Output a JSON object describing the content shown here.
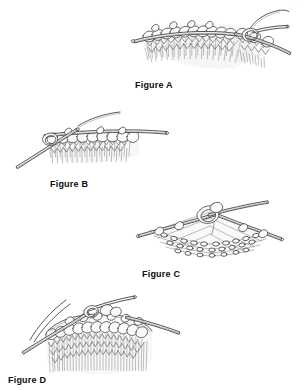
{
  "page": {
    "background_color": "#ffffff",
    "ink_color": "#3b3b3b",
    "caption_color": "#0d0d0d",
    "width": 304,
    "height": 390,
    "content_type": "knitting instruction line drawings"
  },
  "figures": [
    {
      "id": "figure-a",
      "caption": "Figure A",
      "description": "Knitted fabric on a straight needle with a second needle and working yarn at the right; stitches shown in stockinette",
      "art_name": "knitting-illustration-a",
      "x": 131,
      "y": 8,
      "caption_x": 135,
      "caption_y": 80
    },
    {
      "id": "figure-b",
      "caption": "Figure B",
      "description": "Knitted fabric on a needle held horizontally with a second needle crossing from the lower left and yarn strand above",
      "art_name": "knitting-illustration-b",
      "x": 14,
      "y": 110,
      "caption_x": 50,
      "caption_y": 179
    },
    {
      "id": "figure-c",
      "caption": "Figure C",
      "description": "Open knitted mesh stretched between two needles forming a peak with a loop at the top",
      "art_name": "knitting-illustration-c",
      "x": 130,
      "y": 200,
      "caption_x": 142,
      "caption_y": 269
    },
    {
      "id": "figure-d",
      "caption": "Figure D",
      "description": "Tubular knitting in the round on a circular needle with two loose yarn ends at the upper left",
      "art_name": "knitting-illustration-d",
      "x": 22,
      "y": 294,
      "caption_x": 8,
      "caption_y": 375
    }
  ]
}
